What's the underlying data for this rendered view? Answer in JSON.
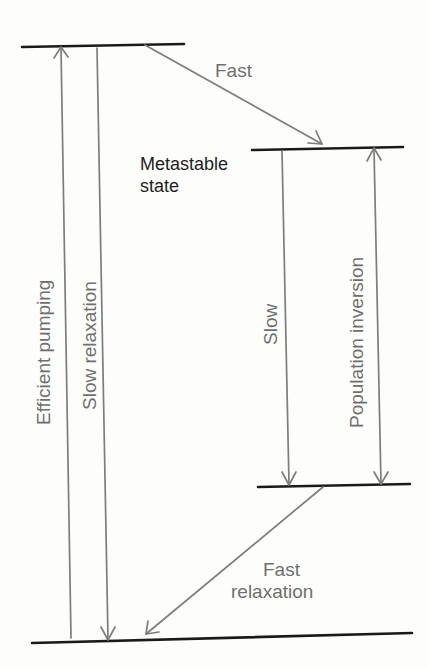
{
  "diagram": {
    "levels": [
      {
        "id": "upper-pump-level",
        "x1": 22,
        "y1": 47,
        "x2": 184,
        "y2": 44
      },
      {
        "id": "metastable-level",
        "x1": 252,
        "y1": 150,
        "x2": 403,
        "y2": 147
      },
      {
        "id": "lower-laser-level",
        "x1": 258,
        "y1": 487,
        "x2": 410,
        "y2": 484
      },
      {
        "id": "ground-level",
        "x1": 32,
        "y1": 643,
        "x2": 412,
        "y2": 633
      }
    ],
    "labels": {
      "metastable_line1": "Metastable",
      "metastable_line2": "state",
      "fast": "Fast",
      "efficient_pumping": "Efficient pumping",
      "slow_relaxation": "Slow relaxation",
      "slow": "Slow",
      "population_inversion": "Population inversion",
      "fast_relaxation_line1": "Fast",
      "fast_relaxation_line2": "relaxation"
    },
    "colors": {
      "level_line": "#1a1a1a",
      "arrow": "#7d7d7d",
      "label_gray": "#6f6f6f",
      "label_dark": "#1e1e1e",
      "background": "#fdfdfb"
    }
  }
}
